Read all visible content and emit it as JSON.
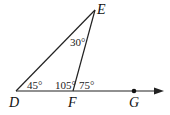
{
  "diagram": {
    "type": "geometry-triangle-exterior-angle",
    "points": {
      "D": {
        "label": "D",
        "x": 16,
        "y": 91
      },
      "E": {
        "label": "E",
        "x": 95,
        "y": 10
      },
      "F": {
        "label": "F",
        "x": 73,
        "y": 91
      },
      "G": {
        "label": "G",
        "x": 134,
        "y": 91
      }
    },
    "segments": [
      "DE",
      "EF",
      "DF"
    ],
    "ray": {
      "from": "D",
      "through": "G",
      "end_x": 163
    },
    "angles": {
      "D": "45°",
      "E": "30°",
      "DFE": "105°",
      "EFG": "75°"
    },
    "stroke_color": "#222222"
  }
}
